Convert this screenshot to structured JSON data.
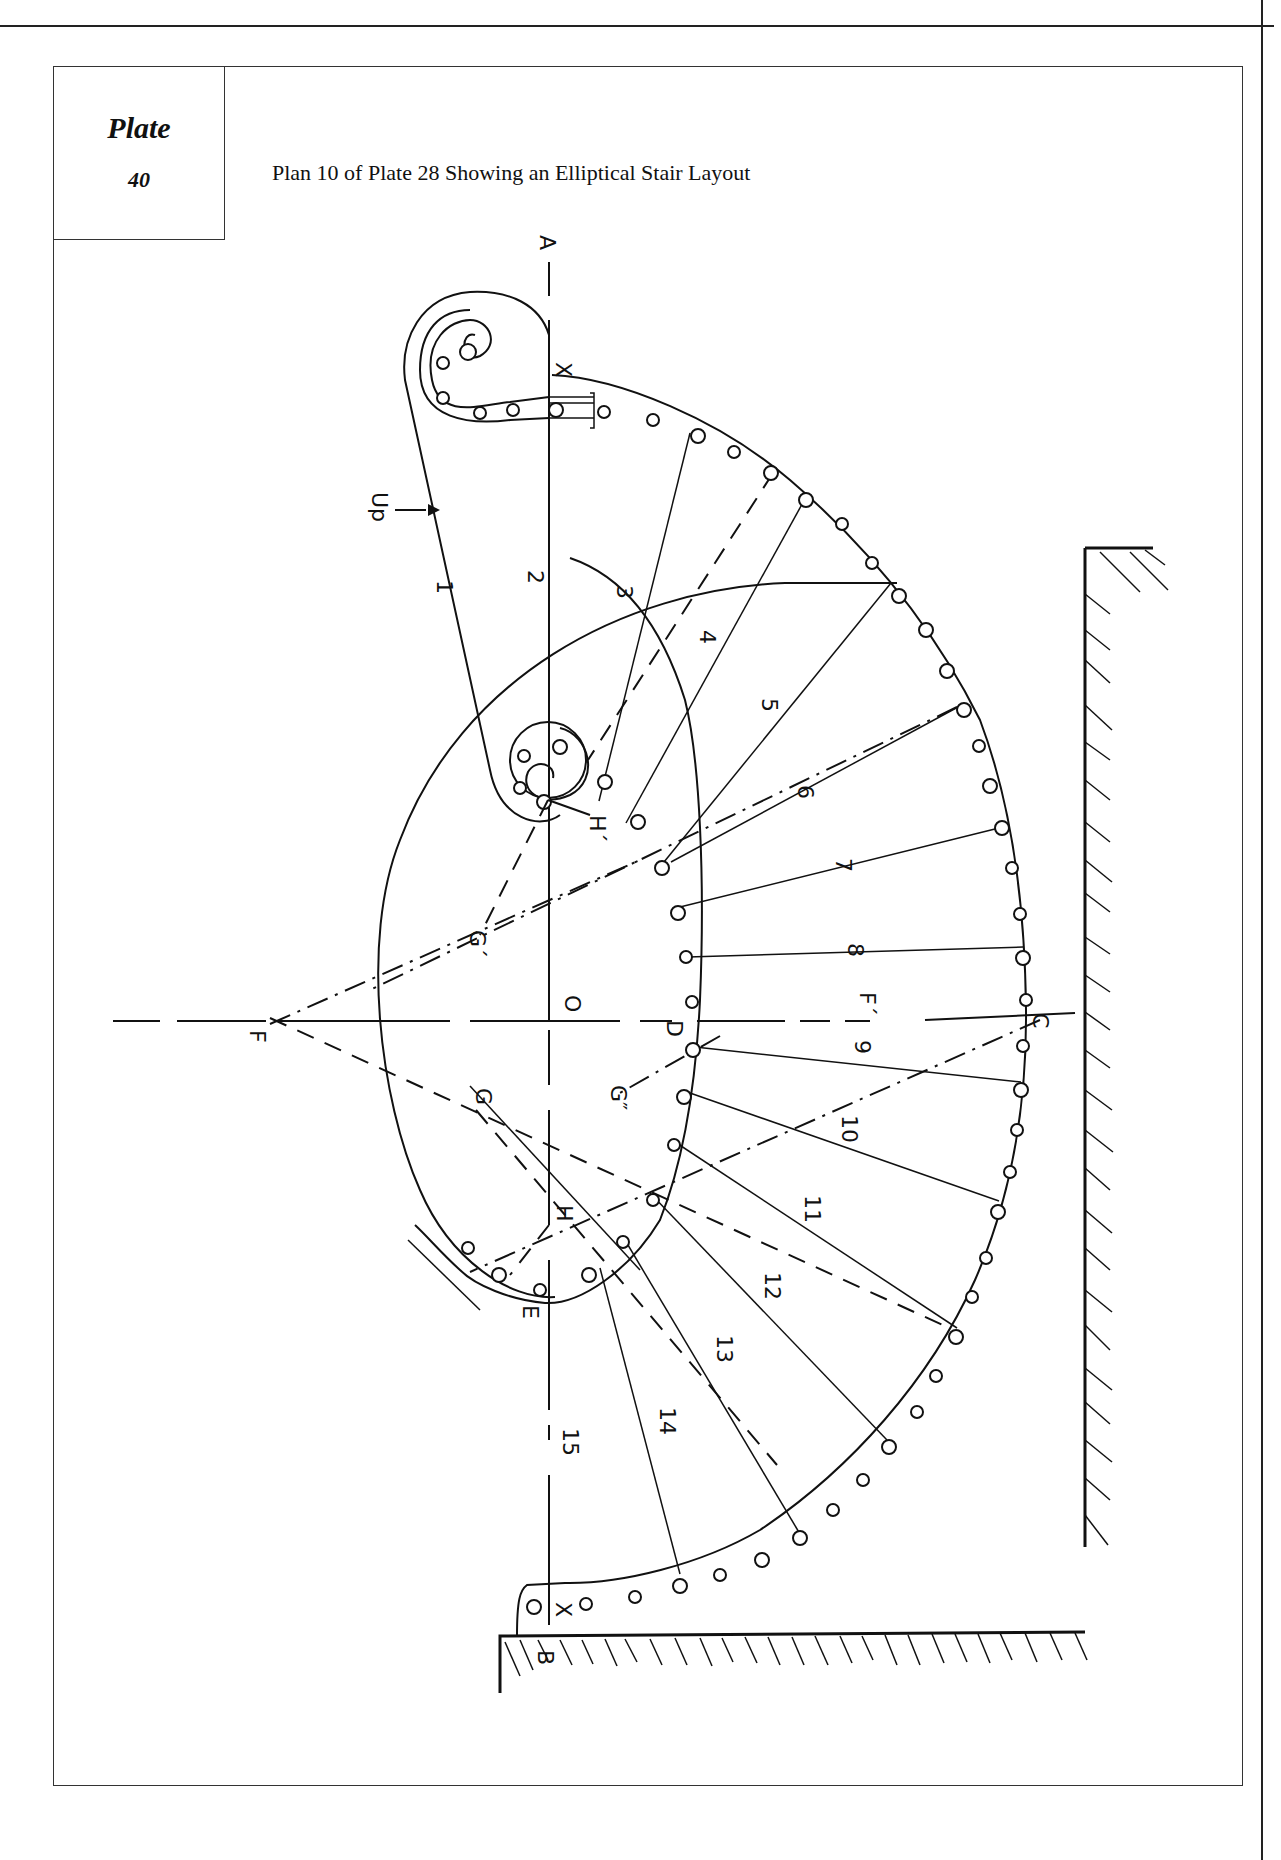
{
  "plate": {
    "word": "Plate",
    "number": "40"
  },
  "caption": "Plan 10 of Plate 28 Showing an Elliptical Stair Layout",
  "direction_label": "Up",
  "points": {
    "A": "A",
    "B": "B",
    "C": "C",
    "D": "D",
    "E": "E",
    "F": "F",
    "F_prime": "F´",
    "G": "G",
    "G_prime": "G´",
    "G_double_prime": "G″",
    "H": "H",
    "H_prime": "H´",
    "O": "O",
    "X_top": "X",
    "X_bottom": "X"
  },
  "step_numbers": [
    "1",
    "2",
    "3",
    "4",
    "5",
    "6",
    "7",
    "8",
    "9",
    "10",
    "11",
    "12",
    "13",
    "14",
    "15"
  ],
  "colors": {
    "ink": "#111111",
    "paper": "#ffffff"
  }
}
